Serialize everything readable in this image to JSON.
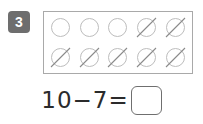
{
  "worksheet": {
    "problem_number": "3",
    "counter_grid": {
      "columns": 5,
      "rows": 2,
      "total_counters": 10,
      "crossed_out_count": 7,
      "remaining_count": 3,
      "cells": [
        [
          {
            "state": "open"
          },
          {
            "state": "open"
          },
          {
            "state": "open"
          },
          {
            "state": "crossed"
          },
          {
            "state": "crossed"
          }
        ],
        [
          {
            "state": "crossed"
          },
          {
            "state": "crossed"
          },
          {
            "state": "crossed"
          },
          {
            "state": "crossed"
          },
          {
            "state": "crossed"
          }
        ]
      ]
    },
    "equation": {
      "expression": "10−7=",
      "minuend": "10",
      "operator": "−",
      "subtrahend": "7",
      "equals": "=",
      "answer_value": "",
      "answer_placeholder": ""
    },
    "colors": {
      "badge_background": "#6e6e6e",
      "badge_text": "#ffffff",
      "grid_border": "#a9a9a9",
      "counter_ring": "#bdbdbd",
      "counter_slash": "#8a8a8a",
      "equation_text": "#2b2b2b",
      "answer_box_border": "#6f6f6f",
      "page_background": "#ffffff"
    }
  }
}
